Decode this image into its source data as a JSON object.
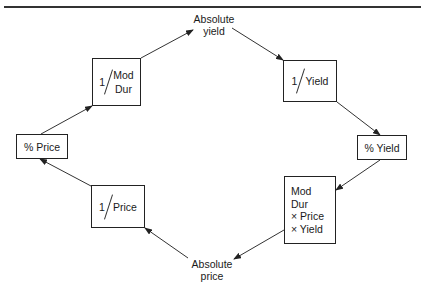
{
  "caption_clipped": "",
  "diagram": {
    "nodes": {
      "absolute_yield": {
        "line1": "Absolute",
        "line2": "yield"
      },
      "inv_mod_dur": {
        "num": "1",
        "den_line1": "Mod",
        "den_line2": "Dur"
      },
      "inv_yield": {
        "num": "1",
        "den": "Yield"
      },
      "pct_price": {
        "label": "% Price"
      },
      "pct_yield": {
        "label": "% Yield"
      },
      "inv_price": {
        "num": "1",
        "den": "Price"
      },
      "mod_dur_product": {
        "line1": "Mod",
        "line2": "Dur",
        "line3": "× Price",
        "line4": "× Yield"
      },
      "absolute_price": {
        "line1": "Absolute",
        "line2": "price"
      }
    },
    "edges": [
      {
        "from": "inv_mod_dur",
        "to": "absolute_yield"
      },
      {
        "from": "absolute_yield",
        "to": "inv_yield"
      },
      {
        "from": "inv_yield",
        "to": "pct_yield"
      },
      {
        "from": "pct_yield",
        "to": "mod_dur_product"
      },
      {
        "from": "mod_dur_product",
        "to": "absolute_price"
      },
      {
        "from": "absolute_price",
        "to": "inv_price"
      },
      {
        "from": "inv_price",
        "to": "pct_price"
      },
      {
        "from": "pct_price",
        "to": "inv_mod_dur"
      }
    ]
  }
}
